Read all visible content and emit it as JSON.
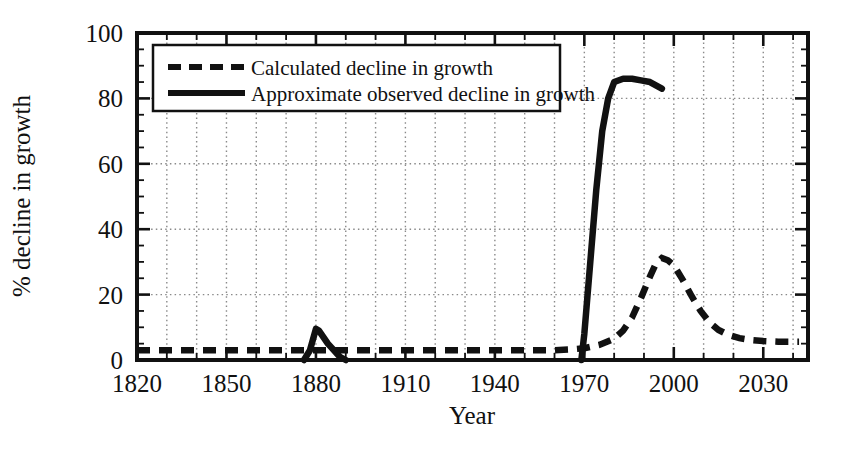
{
  "chart_data": {
    "type": "line",
    "title": "",
    "xlabel": "Year",
    "ylabel": "% decline in growth",
    "xlim": [
      1820,
      2045
    ],
    "ylim": [
      0,
      100
    ],
    "xticks": [
      1820,
      1850,
      1880,
      1910,
      1940,
      1970,
      2000,
      2030
    ],
    "xtick_labels": [
      "1820",
      "1850",
      "1880",
      "1910",
      "1940",
      "1970",
      "2000",
      "2030"
    ],
    "yticks": [
      0,
      20,
      40,
      60,
      80,
      100
    ],
    "ytick_labels": [
      "0",
      "20",
      "40",
      "60",
      "80",
      "100"
    ],
    "x_minor_tick_step": 10,
    "y_minor_tick_step": 5,
    "grid": "dotted-both",
    "legend_position": "upper-left-inside",
    "series": [
      {
        "name": "Calculated decline in growth",
        "style": "dashed",
        "color": "#111111",
        "points": [
          [
            1820,
            3.0
          ],
          [
            1840,
            3.0
          ],
          [
            1860,
            3.0
          ],
          [
            1880,
            3.0
          ],
          [
            1900,
            3.0
          ],
          [
            1920,
            3.0
          ],
          [
            1940,
            3.0
          ],
          [
            1950,
            3.0
          ],
          [
            1960,
            3.0
          ],
          [
            1965,
            3.2
          ],
          [
            1970,
            3.6
          ],
          [
            1975,
            4.6
          ],
          [
            1980,
            6.5
          ],
          [
            1983,
            9.0
          ],
          [
            1986,
            13.0
          ],
          [
            1989,
            19.0
          ],
          [
            1992,
            25.5
          ],
          [
            1994,
            29.5
          ],
          [
            1996,
            31.2
          ],
          [
            1998,
            30.5
          ],
          [
            2000,
            29.0
          ],
          [
            2003,
            24.5
          ],
          [
            2006,
            19.5
          ],
          [
            2009,
            15.0
          ],
          [
            2012,
            11.5
          ],
          [
            2015,
            9.2
          ],
          [
            2018,
            7.8
          ],
          [
            2022,
            6.7
          ],
          [
            2026,
            6.1
          ],
          [
            2030,
            5.8
          ],
          [
            2035,
            5.6
          ],
          [
            2042,
            5.6
          ]
        ]
      },
      {
        "name": "Approximate observed decline in growth",
        "style": "solid",
        "color": "#111111",
        "segments": [
          {
            "label": "1880s spike",
            "points": [
              [
                1876,
                0.0
              ],
              [
                1878,
                3.0
              ],
              [
                1880,
                9.5
              ],
              [
                1881,
                9.0
              ],
              [
                1884,
                5.0
              ],
              [
                1888,
                1.0
              ],
              [
                1890,
                0.0
              ]
            ]
          },
          {
            "label": "modern rise and plateau",
            "points": [
              [
                1969,
                0.0
              ],
              [
                1970,
                8.0
              ],
              [
                1972,
                30.0
              ],
              [
                1974,
                52.0
              ],
              [
                1976,
                70.0
              ],
              [
                1978,
                80.0
              ],
              [
                1980,
                85.0
              ],
              [
                1983,
                86.0
              ],
              [
                1986,
                86.0
              ],
              [
                1989,
                85.5
              ],
              [
                1992,
                85.0
              ],
              [
                1994,
                84.0
              ],
              [
                1996,
                83.0
              ]
            ]
          }
        ]
      }
    ],
    "legend_entries": [
      {
        "label": "Calculated decline in growth",
        "style": "dashed"
      },
      {
        "label": "Approximate observed decline in growth",
        "style": "solid"
      }
    ],
    "annotations": []
  }
}
